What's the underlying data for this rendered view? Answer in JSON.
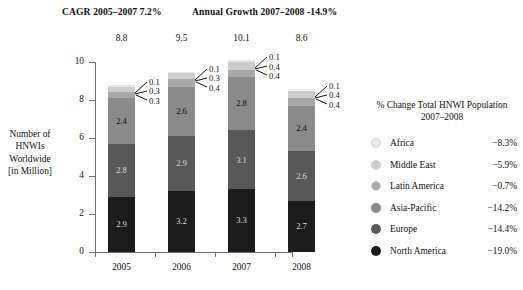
{
  "headers": {
    "cagr": "CAGR 2005–2007 7.2%",
    "annual": "Annual Growth 2007–2008 -14.9%"
  },
  "axis": {
    "y_caption": "Number of HNWIs Worldwide [in Million]",
    "y_ticks": [
      "0",
      "2",
      "4",
      "6",
      "8",
      "10"
    ],
    "x_ticks": [
      "2005",
      "2006",
      "2007",
      "2008"
    ]
  },
  "legend": {
    "title": "% Change Total HNWI Population 2007–2008",
    "title_line1": "% Change Total HNWI Population",
    "title_line2": "2007–2008",
    "items": [
      {
        "label": "Africa",
        "value": "−8.3%",
        "color": "#e8e8e8"
      },
      {
        "label": "Middle East",
        "value": "−5.9%",
        "color": "#cccccc"
      },
      {
        "label": "Latin America",
        "value": "−0.7%",
        "color": "#a8a8a8"
      },
      {
        "label": "Asia-Pacific",
        "value": "−14.2%",
        "color": "#8a8a8a"
      },
      {
        "label": "Europe",
        "value": "−14.4%",
        "color": "#585858"
      },
      {
        "label": "North America",
        "value": "−19.0%",
        "color": "#1c1c1c"
      }
    ]
  },
  "chart_data": {
    "type": "bar",
    "stacked": true,
    "title": "Number of HNWIs Worldwide [in Million]",
    "xlabel": "",
    "ylabel": "Number of HNWIs Worldwide [in Million]",
    "ylim": [
      0,
      10
    ],
    "yticks": [
      0,
      2,
      4,
      6,
      8,
      10
    ],
    "grid": false,
    "legend_position": "right",
    "categories": [
      "2005",
      "2006",
      "2007",
      "2008"
    ],
    "totals": [
      "8.8",
      "9.5",
      "10.1",
      "8.6"
    ],
    "totals_values": [
      8.8,
      9.5,
      10.1,
      8.6
    ],
    "series": [
      {
        "name": "North America",
        "color": "#1c1c1c",
        "values": [
          2.9,
          3.2,
          3.3,
          2.7
        ],
        "labels": [
          "2.9",
          "3.2",
          "3.3",
          "2.7"
        ]
      },
      {
        "name": "Europe",
        "color": "#585858",
        "values": [
          2.8,
          2.9,
          3.1,
          2.6
        ],
        "labels": [
          "2.8",
          "2.9",
          "3.1",
          "2.6"
        ]
      },
      {
        "name": "Asia-Pacific",
        "color": "#8a8a8a",
        "values": [
          2.4,
          2.6,
          2.8,
          2.4
        ],
        "labels": [
          "2.4",
          "2.6",
          "2.8",
          "2.4"
        ]
      },
      {
        "name": "Latin America",
        "color": "#a8a8a8",
        "values": [
          0.3,
          0.4,
          0.4,
          0.4
        ],
        "labels": [
          "0.3",
          "0.4",
          "0.4",
          "0.4"
        ]
      },
      {
        "name": "Middle East",
        "color": "#cccccc",
        "values": [
          0.3,
          0.3,
          0.4,
          0.4
        ],
        "labels": [
          "0.3",
          "0.3",
          "0.4",
          "0.4"
        ]
      },
      {
        "name": "Africa",
        "color": "#e8e8e8",
        "values": [
          0.1,
          0.1,
          0.1,
          0.1
        ],
        "labels": [
          "0.1",
          "0.1",
          "0.1",
          "0.1"
        ]
      }
    ],
    "callouts": [
      {
        "category": "2005",
        "labels": [
          "0.1",
          "0.3",
          "0.3"
        ]
      },
      {
        "category": "2006",
        "labels": [
          "0.1",
          "0.3",
          "0.4"
        ]
      },
      {
        "category": "2007",
        "labels": [
          "0.1",
          "0.4",
          "0.4"
        ]
      },
      {
        "category": "2008",
        "labels": [
          "0.1",
          "0.4",
          "0.4"
        ]
      }
    ],
    "annotations": [
      "CAGR 2005–2007 7.2%",
      "Annual Growth 2007–2008 -14.9%"
    ]
  }
}
